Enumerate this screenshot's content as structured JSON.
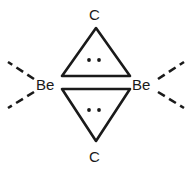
{
  "diagram": {
    "type": "chemical-structure",
    "stroke_color": "#1a1a1a",
    "background_color": "#ffffff",
    "atoms": [
      {
        "id": "c-top",
        "label": "C",
        "position": "top"
      },
      {
        "id": "c-bottom",
        "label": "C",
        "position": "bottom"
      },
      {
        "id": "be-left",
        "label": "Be",
        "position": "left"
      },
      {
        "id": "be-right",
        "label": "Be",
        "position": "right"
      }
    ],
    "lone_pairs": [
      {
        "id": "lone-pair-upper",
        "dots": 2,
        "location": "upper-triangle"
      },
      {
        "id": "lone-pair-lower",
        "dots": 2,
        "location": "lower-triangle"
      }
    ],
    "rings": [
      {
        "id": "upper-triangle",
        "orientation": "apex-up",
        "sides": 3
      },
      {
        "id": "lower-triangle",
        "orientation": "apex-down",
        "sides": 3
      }
    ],
    "bonds": [
      {
        "id": "dashed-bond-upper-left",
        "style": "dashed",
        "from": "be-left",
        "direction": "upper-left"
      },
      {
        "id": "dashed-bond-lower-left",
        "style": "dashed",
        "from": "be-left",
        "direction": "lower-left"
      },
      {
        "id": "dashed-bond-upper-right",
        "style": "dashed",
        "from": "be-right",
        "direction": "upper-right"
      },
      {
        "id": "dashed-bond-lower-right",
        "style": "dashed",
        "from": "be-right",
        "direction": "lower-right"
      }
    ]
  }
}
